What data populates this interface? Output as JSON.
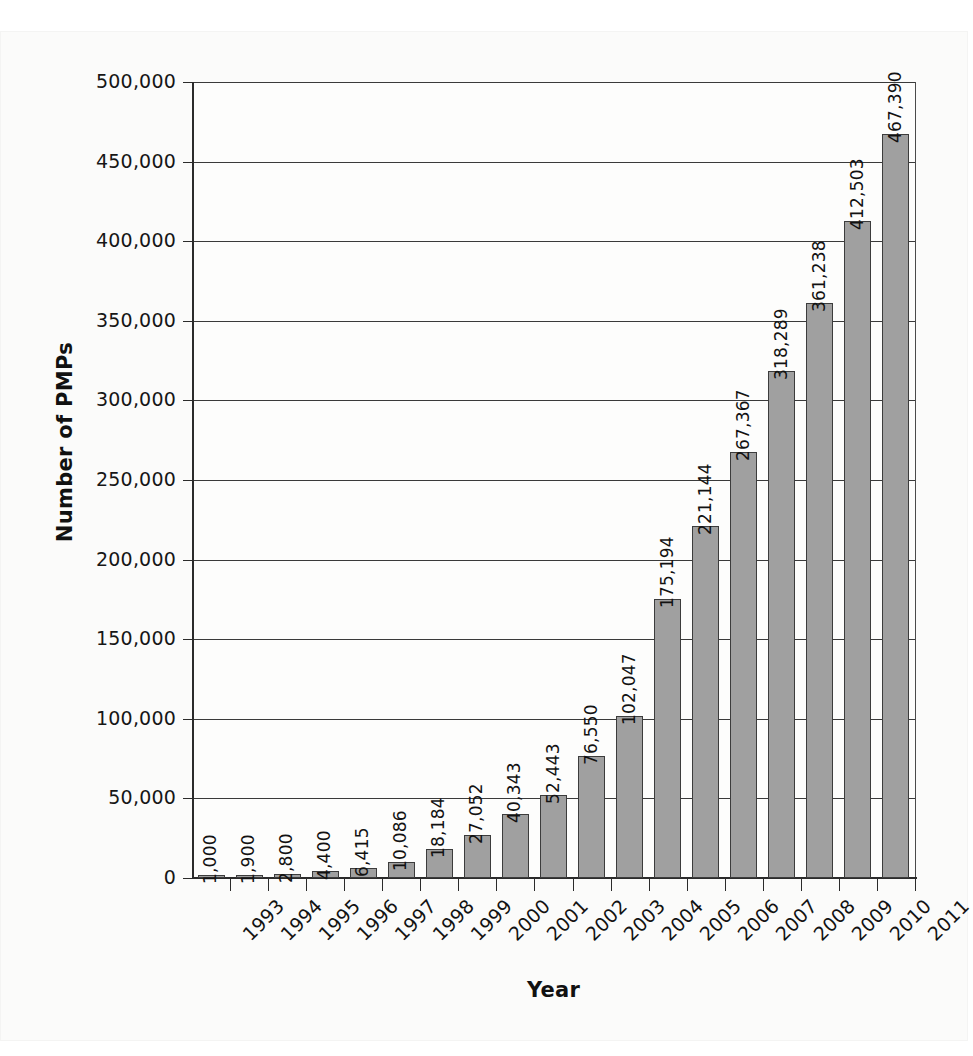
{
  "chart_data": {
    "type": "bar",
    "title": "",
    "xlabel": "Year",
    "ylabel": "Number of PMPs",
    "categories": [
      "1993",
      "1994",
      "1995",
      "1996",
      "1997",
      "1998",
      "1999",
      "2000",
      "2001",
      "2002",
      "2003",
      "2004",
      "2005",
      "2006",
      "2007",
      "2008",
      "2009",
      "2010",
      "2011"
    ],
    "values": [
      1000,
      1900,
      2800,
      4400,
      6415,
      10086,
      18184,
      27052,
      40343,
      52443,
      76550,
      102047,
      175194,
      221144,
      267367,
      318289,
      361238,
      412503,
      467390
    ],
    "value_labels": [
      "1,000",
      "1,900",
      "2,800",
      "4,400",
      "6,415",
      "10,086",
      "18,184",
      "27,052",
      "40,343",
      "52,443",
      "76,550",
      "102,047",
      "175,194",
      "221,144",
      "267,367",
      "318,289",
      "361,238",
      "412,503",
      "467,390"
    ],
    "ylim": [
      0,
      500000
    ],
    "ytick_values": [
      0,
      50000,
      100000,
      150000,
      200000,
      250000,
      300000,
      350000,
      400000,
      450000,
      500000
    ],
    "ytick_labels": [
      "0",
      "50,000",
      "100,000",
      "150,000",
      "200,000",
      "250,000",
      "300,000",
      "350,000",
      "400,000",
      "450,000",
      "500,000"
    ],
    "grid": true,
    "legend": "none",
    "series": [
      {
        "name": "Number of PMPs",
        "color": "#a0a0a0",
        "values": [
          1000,
          1900,
          2800,
          4400,
          6415,
          10086,
          18184,
          27052,
          40343,
          52443,
          76550,
          102047,
          175194,
          221144,
          267367,
          318289,
          361238,
          412503,
          467390
        ]
      }
    ]
  },
  "colors": {
    "bar_fill": "#a0a0a0",
    "bar_stroke": "#3c3c3c",
    "axis": "#2b2b2b",
    "grid": "#3a3a3a",
    "text": "#121212",
    "page": "#fbfbfa"
  }
}
